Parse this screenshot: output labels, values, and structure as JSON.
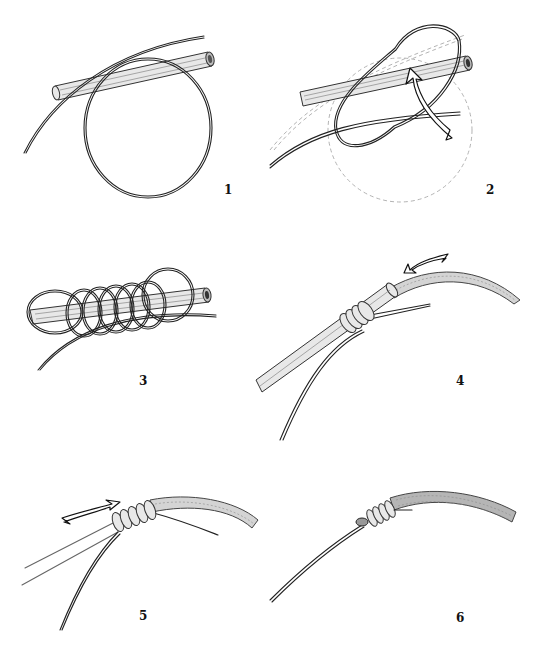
{
  "figure": {
    "steps": [
      {
        "number": "1",
        "caption": "Line laid along tube, loop formed"
      },
      {
        "number": "2",
        "caption": "Loop wrapped over tube (arrow shows direction)"
      },
      {
        "number": "3",
        "caption": "Multiple wraps around tube and line"
      },
      {
        "number": "4",
        "caption": "Tag pushed through tube, fly line inserted (arrow)"
      },
      {
        "number": "5",
        "caption": "Tube withdrawn, wraps tightened (arrow)"
      },
      {
        "number": "6",
        "caption": "Finished knot on fly line"
      }
    ]
  }
}
